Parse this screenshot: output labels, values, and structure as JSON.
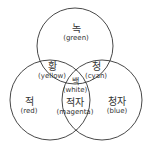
{
  "diagram": {
    "type": "venn-3",
    "stroke_color": "#333333",
    "circles": [
      {
        "name": "green",
        "cx": 75,
        "cy": 46,
        "r": 38
      },
      {
        "name": "red",
        "cx": 50,
        "cy": 100,
        "r": 40
      },
      {
        "name": "blue",
        "cx": 102,
        "cy": 100,
        "r": 40
      }
    ],
    "regions": {
      "green": {
        "ko": "녹",
        "en": "(green)"
      },
      "yellow": {
        "ko": "황",
        "en": "(yellow)"
      },
      "cyan": {
        "ko": "청",
        "en": "(cyan)"
      },
      "white": {
        "ko": "백",
        "en": "(white)"
      },
      "red": {
        "ko": "적",
        "en": "(red)"
      },
      "magenta": {
        "ko": "적자",
        "en": "(magenta)"
      },
      "blue": {
        "ko": "청자",
        "en": "(blue)"
      }
    }
  }
}
